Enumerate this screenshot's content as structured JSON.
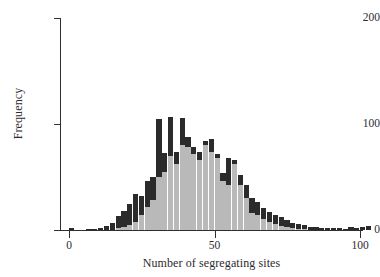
{
  "chart_data": {
    "type": "bar",
    "subtype": "stacked-histogram",
    "title": "",
    "xlabel": "Number of segregating sites",
    "ylabel": "Frequency",
    "xlim": [
      0,
      103
    ],
    "ylim": [
      0,
      200
    ],
    "xticks": [
      0,
      50,
      100
    ],
    "xtick_labels": [
      "0",
      "50",
      "100"
    ],
    "yticks": [
      0,
      100,
      200
    ],
    "ytick_labels": [
      "0",
      "100",
      "200"
    ],
    "grid": false,
    "legend": "none",
    "bin_width": 2,
    "colors": {
      "light_series": "#b9b9b9",
      "dark_series": "#2b2b2b",
      "axis": "#2f2f33",
      "background": "#ffffff"
    },
    "series": [
      {
        "name": "light",
        "values": [
          0,
          0,
          0,
          0,
          0,
          0,
          0,
          0,
          2,
          3,
          5,
          8,
          14,
          22,
          28,
          50,
          55,
          70,
          62,
          80,
          78,
          72,
          66,
          80,
          74,
          68,
          46,
          42,
          62,
          42,
          30,
          16,
          14,
          10,
          8,
          6,
          4,
          3,
          2,
          1,
          1,
          0,
          0,
          0,
          0,
          0,
          0,
          0,
          0,
          0,
          0,
          0
        ]
      },
      {
        "name": "dark",
        "values": [
          2,
          0,
          0,
          1,
          1,
          2,
          4,
          7,
          11,
          15,
          20,
          26,
          18,
          24,
          22,
          55,
          18,
          37,
          12,
          26,
          10,
          6,
          8,
          4,
          12,
          4,
          8,
          26,
          4,
          10,
          12,
          14,
          12,
          11,
          9,
          8,
          8,
          6,
          5,
          5,
          4,
          3,
          3,
          2,
          2,
          2,
          2,
          1,
          3,
          2,
          3,
          4
        ]
      }
    ],
    "bin_starts": [
      0,
      2,
      4,
      6,
      8,
      10,
      12,
      14,
      16,
      18,
      20,
      22,
      24,
      26,
      28,
      30,
      32,
      34,
      36,
      38,
      40,
      42,
      44,
      46,
      48,
      50,
      52,
      54,
      56,
      58,
      60,
      62,
      64,
      66,
      68,
      70,
      72,
      74,
      76,
      78,
      80,
      82,
      84,
      86,
      88,
      90,
      92,
      94,
      96,
      98,
      100,
      102
    ],
    "totals": [
      2,
      0,
      0,
      1,
      1,
      2,
      4,
      7,
      13,
      18,
      25,
      34,
      32,
      46,
      50,
      105,
      73,
      107,
      74,
      106,
      88,
      78,
      74,
      84,
      86,
      72,
      54,
      68,
      66,
      52,
      42,
      30,
      26,
      21,
      17,
      14,
      12,
      9,
      7,
      6,
      5,
      3,
      3,
      2,
      2,
      2,
      2,
      1,
      3,
      2,
      3,
      4
    ],
    "peak_total": 107,
    "peak_bin_start": 34
  }
}
